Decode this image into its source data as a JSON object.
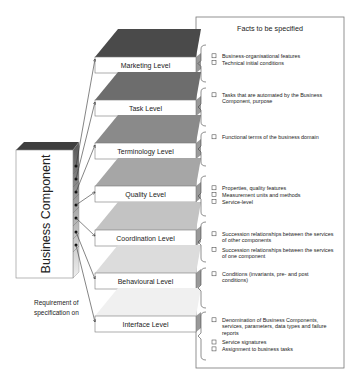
{
  "component": {
    "label": "Business Component"
  },
  "requirement": {
    "line1": "Requirement of",
    "line2": "specification on"
  },
  "facts_box": {
    "title": "Facts to be specified"
  },
  "levels": [
    {
      "label": "Marketing Level",
      "top_color": "#4a4a4a",
      "facts": [
        [
          "Business-organisational features"
        ],
        [
          "Technical initial conditions"
        ]
      ]
    },
    {
      "label": "Task Level",
      "top_color": "#6d6d6d",
      "facts": [
        [
          "Tasks that are automated by the Business",
          "Component, purpose"
        ]
      ]
    },
    {
      "label": "Terminology Level",
      "top_color": "#8a8a8a",
      "facts": [
        [
          "Functional terms of the business domain"
        ]
      ]
    },
    {
      "label": "Quality Level",
      "top_color": "#a6a6a6",
      "facts": [
        [
          "Properties, quality features"
        ],
        [
          "Measurement units and methods"
        ],
        [
          "Service-level"
        ]
      ]
    },
    {
      "label": "Coordination Level",
      "top_color": "#c3c3c3",
      "facts": [
        [
          "Succession relationships between the services",
          "of other components"
        ],
        [
          "Succession relationships between the services",
          "of one component"
        ]
      ]
    },
    {
      "label": "Behavioural Level",
      "top_color": "#dcdcdc",
      "facts": [
        [
          "Conditions (invariants, pre- and post",
          "conditions)"
        ]
      ]
    },
    {
      "label": "Interface Level",
      "top_color": "#f0f0f0",
      "facts": [
        [
          "Denomination of Business Components,",
          "services, parameters, data types and failure",
          "reports"
        ],
        [
          "Service signatures"
        ],
        [
          "Assignment to business tasks"
        ]
      ]
    }
  ]
}
